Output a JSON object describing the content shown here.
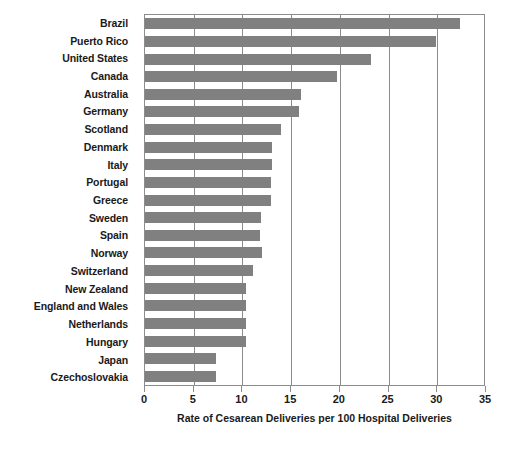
{
  "chart_data": {
    "type": "bar",
    "orientation": "horizontal",
    "title": "",
    "xlabel": "Rate of Cesarean Deliveries per 100 Hospital Deliveries",
    "ylabel": "",
    "xlim": [
      0,
      35
    ],
    "xticks": [
      0,
      5,
      10,
      15,
      20,
      25,
      30,
      35
    ],
    "xtick_labels": [
      "0",
      "5",
      "10",
      "15",
      "20",
      "25",
      "30",
      "35"
    ],
    "grid": "vertical",
    "legend": "none",
    "bar_color": "#808080",
    "axis_color": "#8c8c8c",
    "categories": [
      "Brazil",
      "Puerto Rico",
      "United States",
      "Canada",
      "Australia",
      "Germany",
      "Scotland",
      "Denmark",
      "Italy",
      "Portugal",
      "Greece",
      "Sweden",
      "Spain",
      "Norway",
      "Switzerland",
      "New Zealand",
      "England and Wales",
      "Netherlands",
      "Hungary",
      "Japan",
      "Czechoslovakia"
    ],
    "values": [
      32.3,
      29.9,
      23.2,
      19.7,
      16.0,
      15.8,
      14.0,
      13.0,
      13.0,
      12.9,
      12.9,
      11.9,
      11.8,
      12.0,
      11.1,
      10.4,
      10.4,
      10.4,
      10.4,
      7.3,
      7.3
    ]
  }
}
